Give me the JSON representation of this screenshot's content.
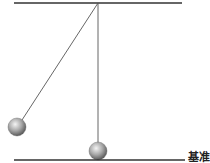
{
  "diagram": {
    "title": "",
    "elements": {
      "ceiling": {
        "x1": 14,
        "y1": 3,
        "x2": 182,
        "y2": 3
      },
      "pivot": {
        "x": 98,
        "y": 3
      },
      "displaced_pendulum": {
        "string_end_x": 22,
        "string_end_y": 122,
        "ball_cx": 17,
        "ball_cy": 127,
        "ball_r": 9
      },
      "rest_pendulum": {
        "string_end_x": 98,
        "string_end_y": 141,
        "ball_cx": 98,
        "ball_cy": 151,
        "ball_r": 9
      },
      "baseline": {
        "x1": 14,
        "y1": 160,
        "x2": 185,
        "y2": 160
      }
    },
    "baseline_label": "基准"
  }
}
